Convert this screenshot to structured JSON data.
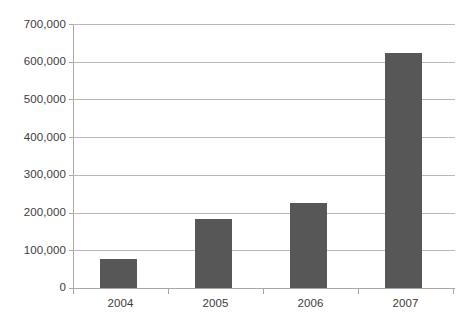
{
  "chart_data": {
    "type": "bar",
    "title": "",
    "subtitle": "",
    "xlabel": "",
    "ylabel": "",
    "categories": [
      "2004",
      "2005",
      "2006",
      "2007"
    ],
    "values": [
      78000,
      182000,
      226000,
      622000
    ],
    "series": [
      {
        "name": "",
        "values": [
          78000,
          182000,
          226000,
          622000
        ]
      }
    ],
    "ylim": [
      0,
      700000
    ],
    "ytick_values": [
      0,
      100000,
      200000,
      300000,
      400000,
      500000,
      600000,
      700000
    ],
    "ytick_labels": [
      "0",
      "100,000",
      "200,000",
      "300,000",
      "400,000",
      "500,000",
      "600,000",
      "700,000"
    ],
    "grid": true,
    "grid_axis": "y",
    "legend": false,
    "legend_position": "none",
    "annotations": [],
    "colors": {
      "bar_fill": "#575757",
      "gridline": "#b9b9b9",
      "axis_line": "#a8a8a8",
      "text": "#3c3c3c",
      "background": "#ffffff"
    }
  }
}
